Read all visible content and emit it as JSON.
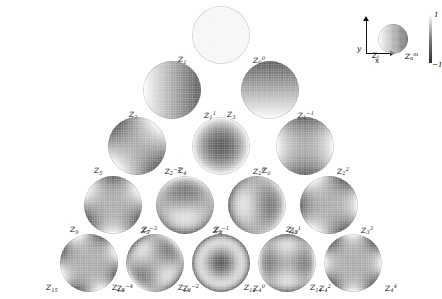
{
  "figure": {
    "colormap": "grayscale",
    "background": "#ffffff",
    "disk_outline_color": "#787878"
  },
  "legend": {
    "x_axis_label": "x",
    "y_axis_label": "y",
    "noll_label": "Z",
    "noll_sub": "j",
    "nm_label": "Z",
    "nm_sub": "n",
    "nm_sup": "m",
    "colorbar": {
      "max_label": "1",
      "min_label": "−1",
      "top_color": "#fdfdfd",
      "mid_color": "#7d7d7d",
      "bottom_color": "#2b2b2b"
    },
    "sample_pattern": "tilt-x"
  },
  "chart_data": {
    "type": "heatmap",
    "xlabel": "x",
    "ylabel": "y",
    "zlim": [
      -1,
      1
    ],
    "grid": false,
    "legend_position": "top-right",
    "colormap": "gray",
    "rows": [
      {
        "n": 0,
        "cells": [
          {
            "noll": "Z",
            "noll_index": "1",
            "n": "0",
            "m": "0",
            "name": "piston",
            "pattern": "uniform"
          }
        ]
      },
      {
        "n": 1,
        "cells": [
          {
            "noll": "Z",
            "noll_index": "2",
            "n": "1",
            "m": "1",
            "name": "tilt-x",
            "pattern": "tilt-x"
          },
          {
            "noll": "Z",
            "noll_index": "3",
            "n": "1",
            "m": "-1",
            "name": "tilt-y",
            "pattern": "tilt-y"
          }
        ]
      },
      {
        "n": 2,
        "cells": [
          {
            "noll": "Z",
            "noll_index": "5",
            "n": "2",
            "m": "-2",
            "name": "oblique astigmatism",
            "pattern": "astig-45"
          },
          {
            "noll": "Z",
            "noll_index": "4",
            "n": "2",
            "m": "0",
            "name": "defocus",
            "pattern": "defocus"
          },
          {
            "noll": "Z",
            "noll_index": "6",
            "n": "2",
            "m": "2",
            "name": "vertical astigmatism",
            "pattern": "astig-0"
          }
        ]
      },
      {
        "n": 3,
        "cells": [
          {
            "noll": "Z",
            "noll_index": "9",
            "n": "3",
            "m": "-3",
            "name": "vertical trefoil",
            "pattern": "trefoil-y"
          },
          {
            "noll": "Z",
            "noll_index": "7",
            "n": "3",
            "m": "-1",
            "name": "vertical coma",
            "pattern": "coma-y"
          },
          {
            "noll": "Z",
            "noll_index": "8",
            "n": "3",
            "m": "1",
            "name": "horizontal coma",
            "pattern": "coma-x"
          },
          {
            "noll": "Z",
            "noll_index": "10",
            "n": "3",
            "m": "3",
            "name": "oblique trefoil",
            "pattern": "trefoil-x"
          }
        ]
      },
      {
        "n": 4,
        "cells": [
          {
            "noll": "Z",
            "noll_index": "15",
            "n": "4",
            "m": "-4",
            "name": "oblique quadrafoil",
            "pattern": "quad-45"
          },
          {
            "noll": "Z",
            "noll_index": "13",
            "n": "4",
            "m": "-2",
            "name": "oblique secondary astigmatism",
            "pattern": "sec-astig-45"
          },
          {
            "noll": "Z",
            "noll_index": "11",
            "n": "4",
            "m": "0",
            "name": "primary spherical",
            "pattern": "spherical"
          },
          {
            "noll": "Z",
            "noll_index": "12",
            "n": "4",
            "m": "2",
            "name": "vertical secondary astigmatism",
            "pattern": "sec-astig-0"
          },
          {
            "noll": "Z",
            "noll_index": "14",
            "n": "4",
            "m": "4",
            "name": "vertical quadrafoil",
            "pattern": "quad-0"
          }
        ]
      }
    ]
  }
}
